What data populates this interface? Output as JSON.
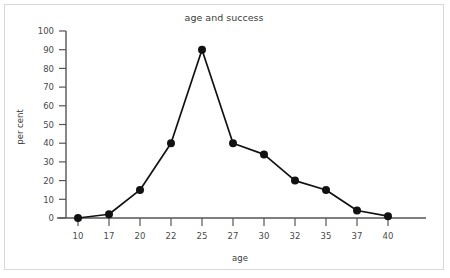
{
  "figure": {
    "background_color": "#ffffff",
    "border_color": "#d8d8d6"
  },
  "chart_data": {
    "type": "line",
    "title": "age and success",
    "xlabel": "age",
    "ylabel": "per cent",
    "categories": [
      "10",
      "17",
      "20",
      "22",
      "25",
      "27",
      "30",
      "32",
      "35",
      "37",
      "40"
    ],
    "values": [
      0,
      2,
      15,
      40,
      90,
      40,
      34,
      20,
      15,
      4,
      1
    ],
    "series": [
      {
        "name": "per cent",
        "values": [
          0,
          2,
          15,
          40,
          90,
          40,
          34,
          20,
          15,
          4,
          1
        ],
        "color": "#121212",
        "marker": "circle"
      }
    ],
    "ylim": [
      0,
      100
    ],
    "ytick_labels": [
      "0",
      "10",
      "20",
      "30",
      "40",
      "50",
      "60",
      "70",
      "80",
      "90",
      "100"
    ],
    "ytick_values": [
      0,
      10,
      20,
      30,
      40,
      50,
      60,
      70,
      80,
      90,
      100
    ],
    "xtick_labels": [
      "10",
      "17",
      "20",
      "22",
      "25",
      "27",
      "30",
      "32",
      "35",
      "37",
      "40"
    ],
    "grid": false,
    "legend": null,
    "line_color": "#121212",
    "axis_color": "#555555"
  }
}
